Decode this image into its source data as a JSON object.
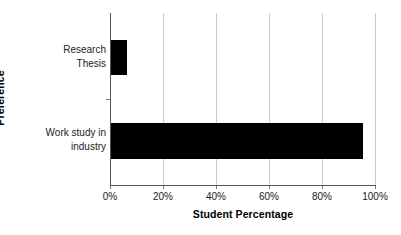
{
  "chart_data": {
    "type": "bar",
    "orientation": "horizontal",
    "title": "",
    "xlabel": "Student Percentage",
    "ylabel": "Preference",
    "categories": [
      "Research Thesis",
      "Work study in industry"
    ],
    "values": [
      6,
      95
    ],
    "series": [
      {
        "name": "Student Percentage",
        "values": [
          6,
          95
        ]
      }
    ],
    "xlim": [
      0,
      100
    ],
    "xticks": [
      0,
      20,
      40,
      60,
      80,
      100
    ],
    "xtick_labels": [
      "0%",
      "20%",
      "40%",
      "60%",
      "80%",
      "100%"
    ],
    "grid": "vertical",
    "legend": "none",
    "bar_color": "#000000",
    "gridline_color": "#c9c9c9",
    "axis_color": "#555555",
    "background_color": "#ffffff"
  },
  "axes": {
    "y_title": "Preference",
    "x_title": "Student Percentage"
  },
  "category_labels": [
    {
      "line1": "Research",
      "line2": "Thesis"
    },
    {
      "line1": "Work study in",
      "line2": "industry"
    }
  ],
  "x_tick_labels": [
    {
      "label": "0%"
    },
    {
      "label": "20%"
    },
    {
      "label": "40%"
    },
    {
      "label": "60%"
    },
    {
      "label": "80%"
    },
    {
      "label": "100%"
    }
  ]
}
